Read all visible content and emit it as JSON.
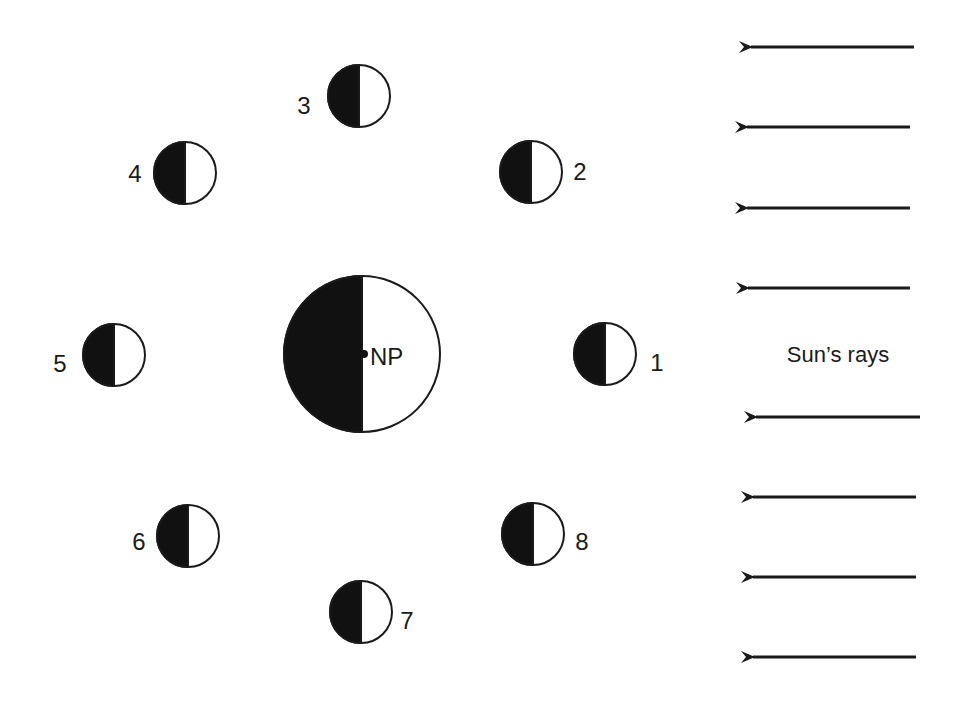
{
  "diagram": {
    "colors": {
      "dark": "#111111",
      "light": "#ffffff",
      "stroke": "#1a1a1a"
    },
    "earth": {
      "label": "NP",
      "cx": 362,
      "cy": 354,
      "r": 78
    },
    "moons": [
      {
        "label": "1",
        "cx": 605,
        "cy": 354,
        "r": 31,
        "lx": 657,
        "ly": 363,
        "anchor": "middle"
      },
      {
        "label": "2",
        "cx": 531,
        "cy": 172,
        "r": 31,
        "lx": 580,
        "ly": 172,
        "anchor": "middle"
      },
      {
        "label": "3",
        "cx": 359,
        "cy": 96,
        "r": 31,
        "lx": 304,
        "ly": 106,
        "anchor": "middle"
      },
      {
        "label": "4",
        "cx": 185,
        "cy": 173,
        "r": 31,
        "lx": 135,
        "ly": 174,
        "anchor": "middle"
      },
      {
        "label": "5",
        "cx": 114,
        "cy": 355,
        "r": 31,
        "lx": 60,
        "ly": 364,
        "anchor": "middle"
      },
      {
        "label": "6",
        "cx": 188,
        "cy": 536,
        "r": 31,
        "lx": 139,
        "ly": 542,
        "anchor": "middle"
      },
      {
        "label": "7",
        "cx": 361,
        "cy": 612,
        "r": 31,
        "lx": 407,
        "ly": 621,
        "anchor": "middle"
      },
      {
        "label": "8",
        "cx": 533,
        "cy": 534,
        "r": 31,
        "lx": 582,
        "ly": 542,
        "anchor": "middle"
      }
    ],
    "sun_label": "Sun’s rays",
    "rays": [
      {
        "x1": 914,
        "x2": 747,
        "y": 47
      },
      {
        "x1": 910,
        "x2": 743,
        "y": 127
      },
      {
        "x1": 910,
        "x2": 743,
        "y": 208
      },
      {
        "x1": 910,
        "x2": 744,
        "y": 288
      },
      {
        "x1": 920,
        "x2": 752,
        "y": 417
      },
      {
        "x1": 916,
        "x2": 749,
        "y": 497
      },
      {
        "x1": 916,
        "x2": 749,
        "y": 577
      },
      {
        "x1": 916,
        "x2": 749,
        "y": 657
      }
    ]
  }
}
